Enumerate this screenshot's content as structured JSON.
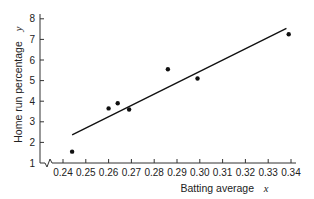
{
  "chart_data": {
    "type": "scatter",
    "title": "",
    "xlabel": "Batting average",
    "xvar": "x",
    "ylabel": "Home run percentage",
    "yvar": "y",
    "xlim": [
      0.24,
      0.34
    ],
    "ylim": [
      1,
      8
    ],
    "x_ticks": [
      "0.24",
      "0.25",
      "0.26",
      "0.27",
      "0.28",
      "0.29",
      "0.30",
      "0.31",
      "0.32",
      "0.33",
      "0.34"
    ],
    "y_ticks": [
      "1",
      "2",
      "3",
      "4",
      "5",
      "6",
      "7",
      "8"
    ],
    "grid": false,
    "axis_break": "x-axis break near origin",
    "points": [
      {
        "x": 0.244,
        "y": 1.55
      },
      {
        "x": 0.26,
        "y": 3.65
      },
      {
        "x": 0.264,
        "y": 3.9
      },
      {
        "x": 0.269,
        "y": 3.6
      },
      {
        "x": 0.286,
        "y": 5.55
      },
      {
        "x": 0.299,
        "y": 5.1
      },
      {
        "x": 0.339,
        "y": 7.25
      }
    ],
    "regression_line": {
      "x1": 0.244,
      "y1": 2.36,
      "x2": 0.338,
      "y2": 7.54
    }
  }
}
